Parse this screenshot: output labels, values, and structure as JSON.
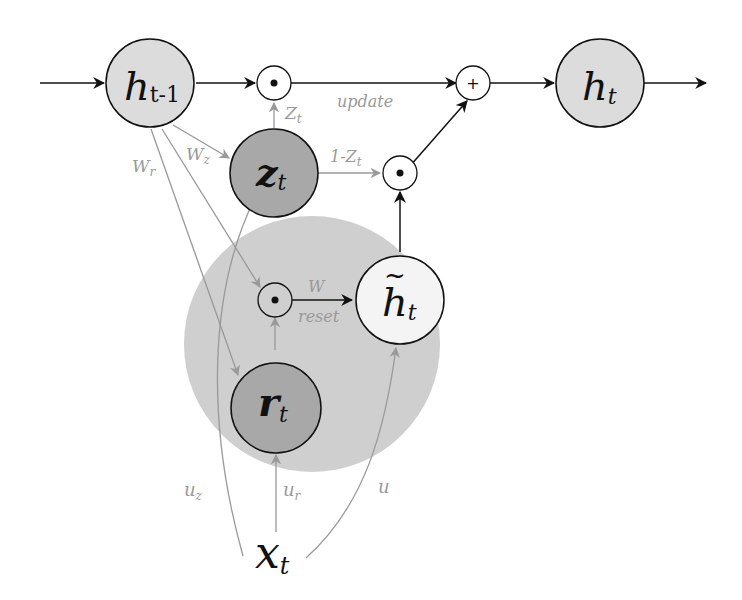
{
  "diagram": {
    "colors": {
      "light_node": "#dcdcdc",
      "dark_node": "#a8a8a8",
      "reset_region": "#cfcfcf",
      "white_node": "#f4f4f4",
      "black_line": "#111111",
      "gray_line": "#999999"
    },
    "nodes": {
      "h_prev": {
        "main": "h",
        "sub": "t-1"
      },
      "h_t": {
        "main": "h",
        "sub": "t"
      },
      "z_t": {
        "main": "z",
        "sub": "t"
      },
      "r_t": {
        "main": "r",
        "sub": "t"
      },
      "h_tilde": {
        "main": "h",
        "sub": "t",
        "accent": "~"
      },
      "x_t": {
        "main": "x",
        "sub": "t"
      }
    },
    "operators": {
      "mult_top": "•",
      "plus": "+",
      "mult_mid": "•",
      "mult_reset": "•"
    },
    "edge_labels": {
      "Wr": {
        "main": "W",
        "sub": "r"
      },
      "Wz": {
        "main": "W",
        "sub": "z"
      },
      "Zt": {
        "main": "Z",
        "sub": "t"
      },
      "one_minus_Zt": {
        "main": "1-Z",
        "sub": "t"
      },
      "update": "update",
      "W": "W",
      "reset": "reset",
      "uz": {
        "main": "u",
        "sub": "z"
      },
      "ur": {
        "main": "u",
        "sub": "r"
      },
      "u": "u"
    }
  }
}
